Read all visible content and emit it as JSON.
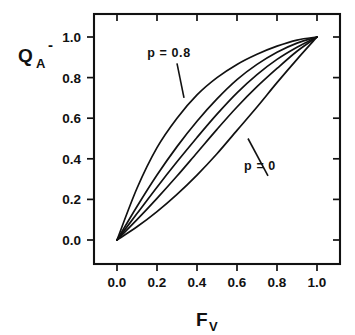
{
  "chart_data": {
    "type": "line",
    "title": "",
    "xlabel": "F_V",
    "xlabel_base": "F",
    "xlabel_sub": "V",
    "ylabel": "Q_A^-",
    "ylabel_base": "Q",
    "ylabel_sub": "A",
    "ylabel_sup": "-",
    "xlim": [
      0.0,
      1.0
    ],
    "ylim": [
      0.0,
      1.0
    ],
    "xticks": [
      0.0,
      0.2,
      0.4,
      0.6,
      0.8,
      1.0
    ],
    "yticks": [
      0.0,
      0.2,
      0.4,
      0.6,
      0.8,
      1.0
    ],
    "xtick_labels": [
      "0.0",
      "0.2",
      "0.4",
      "0.6",
      "0.8",
      "1.0"
    ],
    "ytick_labels": [
      "0.0",
      "0.2",
      "0.4",
      "0.6",
      "0.8",
      "1.0"
    ],
    "grid": false,
    "legend": "none",
    "annotations": [
      {
        "text": "p = 0.8",
        "x": 0.26,
        "y": 0.9,
        "leader_to_x": 0.335,
        "leader_to_y": 0.7
      },
      {
        "text": "p = 0",
        "x": 0.715,
        "y": 0.345,
        "leader_to_x": 0.655,
        "leader_to_y": 0.5
      }
    ],
    "series": [
      {
        "name": "p = 0",
        "p": 0.0,
        "values": [
          [
            0,
            0
          ],
          [
            0.1,
            0.065
          ],
          [
            0.2,
            0.14
          ],
          [
            0.3,
            0.225
          ],
          [
            0.4,
            0.32
          ],
          [
            0.5,
            0.425
          ],
          [
            0.6,
            0.54
          ],
          [
            0.7,
            0.655
          ],
          [
            0.8,
            0.775
          ],
          [
            0.9,
            0.89
          ],
          [
            1.0,
            1.0
          ]
        ]
      },
      {
        "name": "p = 0.2",
        "p": 0.2,
        "values": [
          [
            0,
            0
          ],
          [
            0.1,
            0.1
          ],
          [
            0.2,
            0.205
          ],
          [
            0.3,
            0.315
          ],
          [
            0.4,
            0.43
          ],
          [
            0.5,
            0.545
          ],
          [
            0.6,
            0.655
          ],
          [
            0.7,
            0.755
          ],
          [
            0.8,
            0.845
          ],
          [
            0.9,
            0.93
          ],
          [
            1.0,
            1.0
          ]
        ]
      },
      {
        "name": "p = 0.4",
        "p": 0.4,
        "values": [
          [
            0,
            0
          ],
          [
            0.1,
            0.13
          ],
          [
            0.2,
            0.26
          ],
          [
            0.3,
            0.385
          ],
          [
            0.4,
            0.505
          ],
          [
            0.5,
            0.62
          ],
          [
            0.6,
            0.725
          ],
          [
            0.7,
            0.815
          ],
          [
            0.8,
            0.89
          ],
          [
            0.9,
            0.95
          ],
          [
            1.0,
            1.0
          ]
        ]
      },
      {
        "name": "p = 0.6",
        "p": 0.6,
        "values": [
          [
            0,
            0
          ],
          [
            0.1,
            0.165
          ],
          [
            0.2,
            0.32
          ],
          [
            0.3,
            0.46
          ],
          [
            0.4,
            0.585
          ],
          [
            0.5,
            0.695
          ],
          [
            0.6,
            0.79
          ],
          [
            0.7,
            0.865
          ],
          [
            0.8,
            0.925
          ],
          [
            0.9,
            0.97
          ],
          [
            1.0,
            1.0
          ]
        ]
      },
      {
        "name": "p = 0.8",
        "p": 0.8,
        "values": [
          [
            0,
            0
          ],
          [
            0.1,
            0.255
          ],
          [
            0.2,
            0.455
          ],
          [
            0.3,
            0.6
          ],
          [
            0.4,
            0.715
          ],
          [
            0.5,
            0.8
          ],
          [
            0.6,
            0.865
          ],
          [
            0.7,
            0.915
          ],
          [
            0.8,
            0.955
          ],
          [
            0.9,
            0.985
          ],
          [
            1.0,
            1.0
          ]
        ]
      }
    ],
    "colors": {
      "line": "#111111",
      "axis": "#111111",
      "background": "#ffffff"
    }
  }
}
